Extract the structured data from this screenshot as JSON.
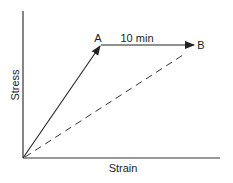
{
  "diagram": {
    "type": "stress-strain",
    "x_axis_label": "Strain",
    "y_axis_label": "Stress",
    "point_a_label": "A",
    "point_b_label": "B",
    "hold_label": "10 min",
    "line_color": "#222222"
  }
}
